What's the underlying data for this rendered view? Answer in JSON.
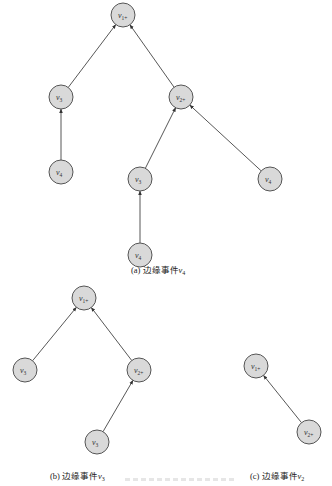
{
  "figure": {
    "subfigures": [
      {
        "id": "a",
        "caption": {
          "prefix": "(a) 边缘事件",
          "var": "v",
          "sub": "4"
        },
        "nodes": [
          {
            "id": "a_v1p",
            "label": "v",
            "sub": "1+",
            "x": 123,
            "y": 15
          },
          {
            "id": "a_v3",
            "label": "v",
            "sub": "3",
            "x": 61,
            "y": 97
          },
          {
            "id": "a_v2p",
            "label": "v",
            "sub": "2+",
            "x": 181,
            "y": 97
          },
          {
            "id": "a_v4a",
            "label": "v",
            "sub": "4",
            "x": 61,
            "y": 172
          },
          {
            "id": "a_v3b",
            "label": "v",
            "sub": "3",
            "x": 140,
            "y": 179
          },
          {
            "id": "a_v4b",
            "label": "v",
            "sub": "4",
            "x": 270,
            "y": 179
          },
          {
            "id": "a_v4c",
            "label": "v",
            "sub": "4",
            "x": 140,
            "y": 255
          }
        ],
        "edges": [
          {
            "from": "a_v3",
            "to": "a_v1p"
          },
          {
            "from": "a_v2p",
            "to": "a_v1p"
          },
          {
            "from": "a_v4a",
            "to": "a_v3"
          },
          {
            "from": "a_v3b",
            "to": "a_v2p"
          },
          {
            "from": "a_v4b",
            "to": "a_v2p"
          },
          {
            "from": "a_v4c",
            "to": "a_v3b"
          }
        ]
      },
      {
        "id": "b",
        "caption": {
          "prefix": "(b) 边缘事件",
          "var": "v",
          "sub": "3"
        },
        "nodes": [
          {
            "id": "b_v1p",
            "label": "v",
            "sub": "1+",
            "x": 84,
            "y": 298
          },
          {
            "id": "b_v3",
            "label": "v",
            "sub": "3",
            "x": 25,
            "y": 370
          },
          {
            "id": "b_v2p",
            "label": "v",
            "sub": "2+",
            "x": 139,
            "y": 370
          },
          {
            "id": "b_v3b",
            "label": "v",
            "sub": "3",
            "x": 97,
            "y": 442
          }
        ],
        "edges": [
          {
            "from": "b_v3",
            "to": "b_v1p"
          },
          {
            "from": "b_v2p",
            "to": "b_v1p"
          },
          {
            "from": "b_v3b",
            "to": "b_v2p"
          }
        ]
      },
      {
        "id": "c",
        "caption": {
          "prefix": "(c) 边缘事件",
          "var": "v",
          "sub": "2"
        },
        "nodes": [
          {
            "id": "c_v1p",
            "label": "v",
            "sub": "1+",
            "x": 256,
            "y": 366
          },
          {
            "id": "c_v2p",
            "label": "v",
            "sub": "2+",
            "x": 309,
            "y": 432
          }
        ],
        "edges": [
          {
            "from": "c_v2p",
            "to": "c_v1p"
          }
        ]
      }
    ],
    "style": {
      "node_radius": 12,
      "node_fill": "#d9d9d9",
      "node_stroke": "#555555",
      "edge_color": "#444444"
    }
  },
  "captions": {
    "a": {
      "prefix": "(a) 边缘事件",
      "var": "v",
      "sub": "4"
    },
    "b": {
      "prefix": "(b) 边缘事件",
      "var": "v",
      "sub": "3"
    },
    "c": {
      "prefix": "(c) 边缘事件",
      "var": "v",
      "sub": "2"
    }
  }
}
